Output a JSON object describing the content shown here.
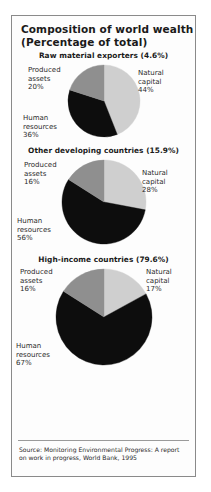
{
  "figure": {
    "title": "Composition of world wealth",
    "subtitle": "(Percentage of total)",
    "source": "Source: Monitoring Environmental Progress: A report on work in progress, World Bank, 1995"
  },
  "colors": {
    "natural_capital": "#cfcfcf",
    "produced_assets": "#8f8f8f",
    "human_resources": "#0d0d0d",
    "border": "#8a8a8a",
    "text": "#2b2b2b"
  },
  "charts": [
    {
      "heading": "Raw material exporters (4.6%)",
      "natural_label_1": "Natural",
      "natural_label_2": "capital",
      "natural_value": "44%",
      "produced_label_1": "Produced",
      "produced_label_2": "assets",
      "produced_value": "20%",
      "human_label_1": "Human",
      "human_label_2": "resources",
      "human_value": "36%"
    },
    {
      "heading": "Other developing countries (15.9%)",
      "natural_label_1": "Natural",
      "natural_label_2": "capital",
      "natural_value": "28%",
      "produced_label_1": "Produced",
      "produced_label_2": "assets",
      "produced_value": "16%",
      "human_label_1": "Human",
      "human_label_2": "resources",
      "human_value": "56%"
    },
    {
      "heading": "High-income countries (79.6%)",
      "natural_label_1": "Natural",
      "natural_label_2": "capital",
      "natural_value": "17%",
      "produced_label_1": "Produced",
      "produced_label_2": "assets",
      "produced_value": "16%",
      "human_label_1": "Human",
      "human_label_2": "resources",
      "human_value": "67%"
    }
  ],
  "chart_data": [
    {
      "type": "pie",
      "title": "Raw material exporters (4.6%)",
      "categories": [
        "Natural capital",
        "Human resources",
        "Produced assets"
      ],
      "values": [
        44,
        36,
        20
      ],
      "unit": "percent",
      "group_share_of_world_wealth": 4.6,
      "start_angle_deg": 0,
      "direction": "clockwise",
      "colors": [
        "#cfcfcf",
        "#0d0d0d",
        "#8f8f8f"
      ],
      "radius_px": 36,
      "legend": "inline-labels"
    },
    {
      "type": "pie",
      "title": "Other developing countries (15.9%)",
      "categories": [
        "Natural capital",
        "Human resources",
        "Produced assets"
      ],
      "values": [
        28,
        56,
        16
      ],
      "unit": "percent",
      "group_share_of_world_wealth": 15.9,
      "start_angle_deg": 0,
      "direction": "clockwise",
      "colors": [
        "#cfcfcf",
        "#0d0d0d",
        "#8f8f8f"
      ],
      "radius_px": 42,
      "legend": "inline-labels"
    },
    {
      "type": "pie",
      "title": "High-income countries (79.6%)",
      "categories": [
        "Natural capital",
        "Human resources",
        "Produced assets"
      ],
      "values": [
        17,
        67,
        16
      ],
      "unit": "percent",
      "group_share_of_world_wealth": 79.6,
      "start_angle_deg": 0,
      "direction": "clockwise",
      "colors": [
        "#cfcfcf",
        "#0d0d0d",
        "#8f8f8f"
      ],
      "radius_px": 48,
      "legend": "inline-labels"
    }
  ]
}
